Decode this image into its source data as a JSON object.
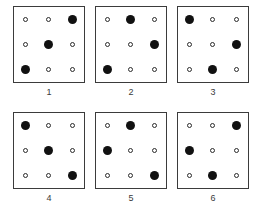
{
  "figure": {
    "name": "dot-pattern-matrix-figure",
    "rows": 2,
    "columns": 3,
    "grid_size": 3,
    "marker_colors": {
      "filled": "#111111",
      "open_stroke": "#2b2b2b",
      "open_fill": "#ffffff",
      "panel_border": "#3b3b3b",
      "background": "#ffffff",
      "label_text": "#3a3a3a"
    },
    "panels": [
      {
        "label": "1",
        "cells": [
          "open",
          "open",
          "filled",
          "open",
          "filled",
          "open",
          "filled",
          "open",
          "open"
        ],
        "filled_positions": [
          "top-right",
          "middle-center",
          "bottom-left"
        ]
      },
      {
        "label": "2",
        "cells": [
          "open",
          "filled",
          "open",
          "open",
          "open",
          "filled",
          "filled",
          "open",
          "open"
        ],
        "filled_positions": [
          "top-center",
          "middle-right",
          "bottom-left"
        ]
      },
      {
        "label": "3",
        "cells": [
          "filled",
          "open",
          "open",
          "open",
          "open",
          "filled",
          "open",
          "filled",
          "open"
        ],
        "filled_positions": [
          "top-left",
          "middle-right",
          "bottom-center"
        ]
      },
      {
        "label": "4",
        "cells": [
          "filled",
          "open",
          "open",
          "open",
          "filled",
          "open",
          "open",
          "open",
          "filled"
        ],
        "filled_positions": [
          "top-left",
          "middle-center",
          "bottom-right"
        ]
      },
      {
        "label": "5",
        "cells": [
          "open",
          "filled",
          "open",
          "filled",
          "open",
          "open",
          "open",
          "open",
          "filled"
        ],
        "filled_positions": [
          "top-center",
          "middle-left",
          "bottom-right"
        ]
      },
      {
        "label": "6",
        "cells": [
          "open",
          "open",
          "filled",
          "filled",
          "open",
          "open",
          "open",
          "filled",
          "open"
        ],
        "filled_positions": [
          "top-right",
          "middle-left",
          "bottom-center"
        ]
      }
    ]
  }
}
